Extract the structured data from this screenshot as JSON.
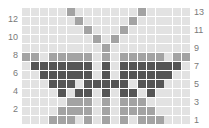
{
  "puzzle": {
    "columns": 19,
    "rows": 13,
    "colors": {
      "empty": "#e2e2e2",
      "medium": "#a3a3a3",
      "dark": "#555555"
    },
    "grid": [
      {
        "row": 13,
        "cells": [
          0,
          0,
          0,
          0,
          0,
          1,
          0,
          0,
          0,
          0,
          0,
          0,
          0,
          1,
          0,
          0,
          0,
          0,
          0
        ]
      },
      {
        "row": 12,
        "cells": [
          0,
          0,
          0,
          0,
          0,
          0,
          1,
          0,
          0,
          0,
          0,
          0,
          1,
          0,
          0,
          0,
          0,
          0,
          0
        ]
      },
      {
        "row": 11,
        "cells": [
          0,
          0,
          0,
          0,
          0,
          0,
          0,
          1,
          0,
          0,
          0,
          1,
          0,
          0,
          0,
          0,
          0,
          0,
          0
        ]
      },
      {
        "row": 10,
        "cells": [
          0,
          0,
          0,
          0,
          0,
          0,
          0,
          0,
          1,
          0,
          1,
          0,
          0,
          0,
          0,
          0,
          0,
          0,
          0
        ]
      },
      {
        "row": 9,
        "cells": [
          0,
          0,
          0,
          0,
          0,
          0,
          0,
          0,
          0,
          1,
          0,
          0,
          0,
          0,
          0,
          0,
          0,
          0,
          0
        ]
      },
      {
        "row": 8,
        "cells": [
          1,
          1,
          0,
          1,
          1,
          1,
          1,
          1,
          0,
          1,
          0,
          1,
          1,
          1,
          1,
          1,
          0,
          1,
          1
        ]
      },
      {
        "row": 7,
        "cells": [
          0,
          2,
          2,
          2,
          2,
          2,
          2,
          2,
          0,
          2,
          0,
          2,
          2,
          2,
          2,
          2,
          2,
          2,
          0
        ]
      },
      {
        "row": 6,
        "cells": [
          0,
          0,
          2,
          2,
          2,
          2,
          2,
          2,
          0,
          2,
          0,
          2,
          2,
          2,
          2,
          2,
          2,
          0,
          0
        ]
      },
      {
        "row": 5,
        "cells": [
          0,
          0,
          0,
          2,
          2,
          2,
          0,
          2,
          2,
          2,
          2,
          2,
          0,
          2,
          2,
          2,
          0,
          0,
          0
        ]
      },
      {
        "row": 4,
        "cells": [
          0,
          0,
          0,
          0,
          2,
          0,
          2,
          2,
          0,
          2,
          0,
          2,
          2,
          0,
          2,
          0,
          0,
          0,
          0
        ]
      },
      {
        "row": 3,
        "cells": [
          0,
          0,
          0,
          0,
          0,
          1,
          1,
          1,
          0,
          1,
          0,
          1,
          1,
          1,
          0,
          0,
          0,
          0,
          0
        ]
      },
      {
        "row": 2,
        "cells": [
          0,
          0,
          0,
          0,
          1,
          1,
          1,
          1,
          0,
          1,
          0,
          1,
          1,
          1,
          1,
          0,
          0,
          0,
          0
        ]
      },
      {
        "row": 1,
        "cells": [
          0,
          0,
          0,
          1,
          1,
          1,
          0,
          1,
          0,
          1,
          0,
          1,
          0,
          1,
          1,
          1,
          0,
          0,
          0
        ]
      }
    ]
  },
  "labels": {
    "left": [
      "12",
      "10",
      "8",
      "6",
      "4",
      "2"
    ],
    "right": [
      "13",
      "11",
      "9",
      "7",
      "5",
      "3",
      "1"
    ]
  }
}
